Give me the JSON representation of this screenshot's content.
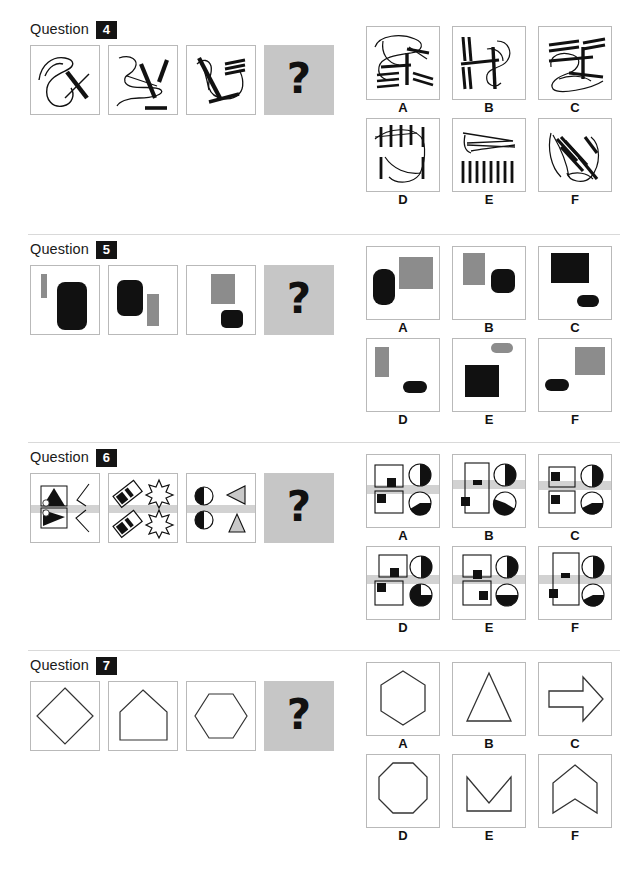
{
  "page": {
    "width": 644,
    "height": 871,
    "background": "#ffffff",
    "question_word": "Question",
    "question_mark_symbol": "?",
    "colors": {
      "badge_background": "#141414",
      "badge_text": "#ffffff",
      "cell_border": "#b9b9b9",
      "separator": "#d9d9d9",
      "question_panel_grey": "#c6c6c6",
      "shape_black": "#111111",
      "shape_grey": "#8c8c8c",
      "highlight_bar_grey": "#d2d2d2"
    }
  },
  "questions": [
    {
      "id": "q4",
      "number": "4",
      "top": 14,
      "separator": false,
      "stem_description": "three panels of scribbled curves with thick straight line strokes, fourth panel is the unknown",
      "stems": [
        {
          "name": "stem-1",
          "desc": "loose curve loop with one thick diagonal stroke crossed by a thin line"
        },
        {
          "name": "stem-2",
          "desc": "zigzag curve with two thick diagonal strokes and one thick horizontal stroke"
        },
        {
          "name": "stem-3",
          "desc": "curve with thick diagonal stroke, three short parallel strokes and a crossing stroke"
        },
        {
          "name": "stem-answer",
          "desc": "grey panel with question mark"
        }
      ],
      "options": [
        {
          "label": "A",
          "desc": "curves with thick vertical stroke and four pairs of short parallel strokes"
        },
        {
          "label": "B",
          "desc": "two pairs of vertical strokes left, curve with thick vertical stroke right"
        },
        {
          "label": "C",
          "desc": "three pairs of horizontal strokes over a looping curve"
        },
        {
          "label": "D",
          "desc": "row of vertical strokes over curves with two lower vertical strokes"
        },
        {
          "label": "E",
          "desc": "thin converging lines above a row of eight vertical strokes"
        },
        {
          "label": "F",
          "desc": "cluster of thick diagonal parallel strokes over thin curves"
        }
      ]
    },
    {
      "id": "q5",
      "number": "5",
      "top": 234,
      "separator": true,
      "stem_description": "panels containing a black rounded rectangle and a grey rectangle in varying sizes and positions",
      "stems": [
        {
          "name": "stem-1",
          "desc": "small grey vertical bar top-left, large black rounded rectangle right"
        },
        {
          "name": "stem-2",
          "desc": "black rounded rectangle left, grey vertical bar right"
        },
        {
          "name": "stem-3",
          "desc": "grey rectangle top, small black rounded square bottom-right"
        },
        {
          "name": "stem-answer",
          "desc": "grey panel with question mark"
        }
      ],
      "options": [
        {
          "label": "A",
          "desc": "black rounded rectangle left, large grey square right"
        },
        {
          "label": "B",
          "desc": "grey rectangle top-left, black rounded square right"
        },
        {
          "label": "C",
          "desc": "large black square top, small black rounded bar below"
        },
        {
          "label": "D",
          "desc": "grey vertical bar top-left, small black rounded bar bottom-right"
        },
        {
          "label": "E",
          "desc": "small grey rounded bar top-right, large black square below"
        },
        {
          "label": "F",
          "desc": "small black rounded bar left, large grey square right"
        }
      ]
    },
    {
      "id": "q6",
      "number": "6",
      "top": 442,
      "separator": true,
      "stem_description": "panels with paired shapes crossed by a horizontal grey highlight bar",
      "stems": [
        {
          "name": "stem-1",
          "desc": "two boxed black triangles left with circles, thin zigzag line right, grey bar across"
        },
        {
          "name": "stem-2",
          "desc": "two striped diamonds left and two black starbursts right, grey bar across"
        },
        {
          "name": "stem-3",
          "desc": "split circle left and two grey triangles right, grey bar across"
        },
        {
          "name": "stem-answer",
          "desc": "grey panel with question mark"
        }
      ],
      "options": [
        {
          "label": "A",
          "desc": "two stacked squares with black blocks, two half-filled circles, grey bar across"
        },
        {
          "label": "B",
          "desc": "tall square with black blocks, two half-filled circles, grey bar across"
        },
        {
          "label": "C",
          "desc": "two stacked squares with black blocks, two half-filled circles, grey bar across"
        },
        {
          "label": "D",
          "desc": "two stacked squares with black blocks, two quarter-filled circles, grey bar across"
        },
        {
          "label": "E",
          "desc": "two stacked squares with black blocks lower-right, two filled circles, grey bar across"
        },
        {
          "label": "F",
          "desc": "tall square with black bar and block, two half-filled circles, grey bar across"
        }
      ]
    },
    {
      "id": "q7",
      "number": "7",
      "top": 650,
      "separator": true,
      "stem_description": "outline polygons: diamond, pentagon/house, hexagon",
      "stems": [
        {
          "name": "stem-1",
          "desc": "diamond outline"
        },
        {
          "name": "stem-2",
          "desc": "house-shaped pentagon outline"
        },
        {
          "name": "stem-3",
          "desc": "hexagon outline"
        },
        {
          "name": "stem-answer",
          "desc": "grey panel with question mark"
        }
      ],
      "options": [
        {
          "label": "A",
          "desc": "hexagon outline"
        },
        {
          "label": "B",
          "desc": "triangle outline"
        },
        {
          "label": "C",
          "desc": "right-pointing arrow outline"
        },
        {
          "label": "D",
          "desc": "octagon outline"
        },
        {
          "label": "E",
          "desc": "chevron-notched square outline"
        },
        {
          "label": "F",
          "desc": "upward chevron outline"
        }
      ]
    }
  ]
}
